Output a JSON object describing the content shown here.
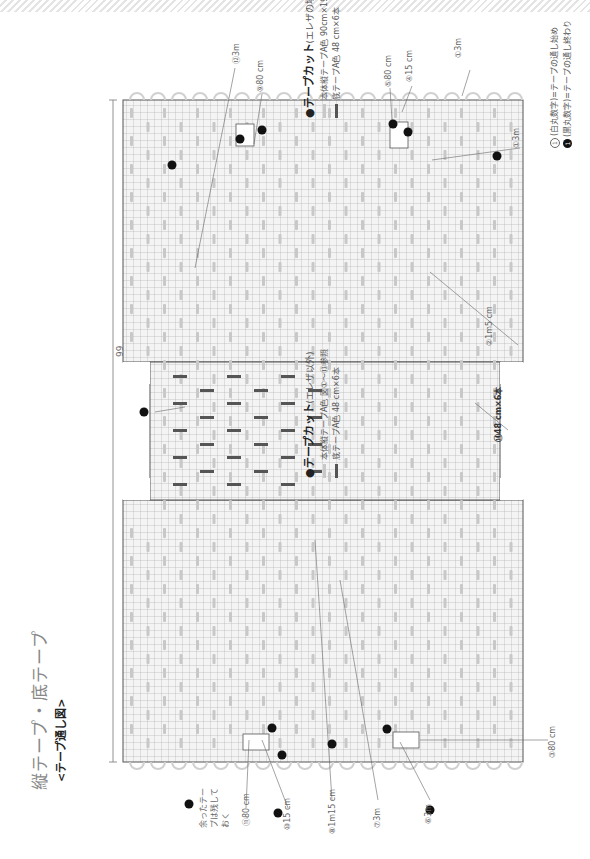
{
  "page": {
    "title": "縦テープ・底テープ",
    "subtitle": "<テープ通し図>"
  },
  "cut_list_a": {
    "heading": "●テープカット",
    "heading_note": "(エレザ以外)",
    "items": [
      {
        "kind": "body",
        "text": "本体縦テープA色 図①〜⑬参照"
      },
      {
        "kind": "bottom",
        "text": "底テープA色 48 cm×6本"
      }
    ]
  },
  "cut_list_b": {
    "heading": "●テープカット",
    "heading_note": "(エレザの場合)",
    "items": [
      {
        "kind": "body",
        "text": "本体縦テープA色 90cm×19本、80cm×4本、10cm×4本"
      },
      {
        "kind": "bottom",
        "text": "底テープA色 48 cm×6本"
      }
    ]
  },
  "legend_notes": [
    {
      "marker": "①",
      "style": "white",
      "text": "(白丸数字)=テープの通し始め"
    },
    {
      "marker": "1",
      "style": "black",
      "text": "(黒丸数字)=テープの通し終わり"
    }
  ],
  "colors": {
    "body_tape": "#c8c8c8",
    "bottom_tape": "#555555",
    "grid": "#9a9a9a",
    "grid_fill": "#f6f6f6",
    "outline": "#555555"
  },
  "diagram": {
    "overall_dimension": "99",
    "bottom_label": "⑭48 cm×6本",
    "callouts": [
      {
        "id": "c1",
        "text": "①3m"
      },
      {
        "id": "c1b",
        "text": "①3m"
      },
      {
        "id": "c2",
        "text": "②1m5 cm"
      },
      {
        "id": "c3",
        "text": "③80 cm"
      },
      {
        "id": "c4",
        "text": "④15 cm"
      },
      {
        "id": "c5",
        "text": "⑤80 cm"
      },
      {
        "id": "c6",
        "text": "⑥3m"
      },
      {
        "id": "c7",
        "text": "⑦3m"
      },
      {
        "id": "c8",
        "text": "⑧1m15 cm"
      },
      {
        "id": "c9",
        "text": "⑨80 cm"
      },
      {
        "id": "c10",
        "text": "⑩15 cm"
      },
      {
        "id": "c11",
        "text": "⑪80 cm"
      },
      {
        "id": "c12",
        "text": "⑫3m"
      },
      {
        "id": "c13",
        "text": "⑬3m"
      }
    ],
    "end_markers": [
      "1",
      "2",
      "3",
      "4",
      "5",
      "6",
      "7",
      "8",
      "9",
      "10",
      "11",
      "12",
      "13",
      "14",
      "15"
    ],
    "leftover_note": "余ったテープは残しておく",
    "leftover_marker": "15"
  }
}
